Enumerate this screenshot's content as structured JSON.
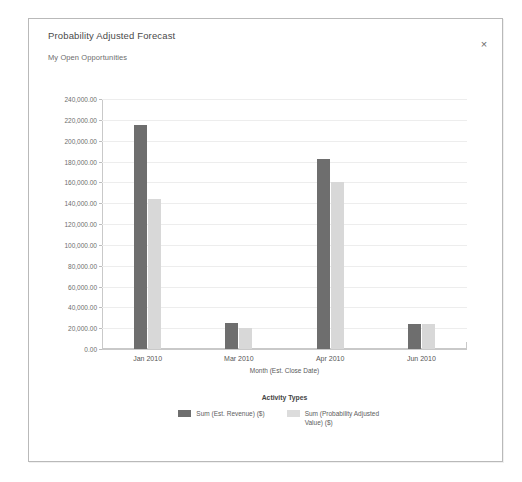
{
  "dialog": {
    "close_label": "×"
  },
  "chart_data": {
    "type": "bar",
    "title": "Probability Adjusted Forecast",
    "subtitle": "My Open Opportunities",
    "xlabel": "Month (Est. Close Date)",
    "ylabel": "",
    "legend_title": "Activity Types",
    "legend_position": "bottom",
    "grid": true,
    "ylim": [
      0,
      240000
    ],
    "ytick_interval": 20000,
    "ytick_labels": [
      "0.00",
      "20,000.00",
      "40,000.00",
      "60,000.00",
      "80,000.00",
      "100,000.00",
      "120,000.00",
      "140,000.00",
      "160,000.00",
      "180,000.00",
      "200,000.00",
      "220,000.00",
      "240,000.00"
    ],
    "ytick_values": [
      0,
      20000,
      40000,
      60000,
      80000,
      100000,
      120000,
      140000,
      160000,
      180000,
      200000,
      220000,
      240000
    ],
    "categories": [
      "Jan 2010",
      "Mar 2010",
      "Apr 2010",
      "Jun 2010"
    ],
    "series": [
      {
        "name": "Sum (Est. Revenue) ($)",
        "color": "#6e6e6e",
        "values": [
          215000,
          25000,
          182000,
          24000
        ]
      },
      {
        "name": "Sum (Probability Adjusted Value) ($)",
        "color": "#d8d8d8",
        "values": [
          144000,
          20000,
          160000,
          24000
        ]
      }
    ]
  }
}
